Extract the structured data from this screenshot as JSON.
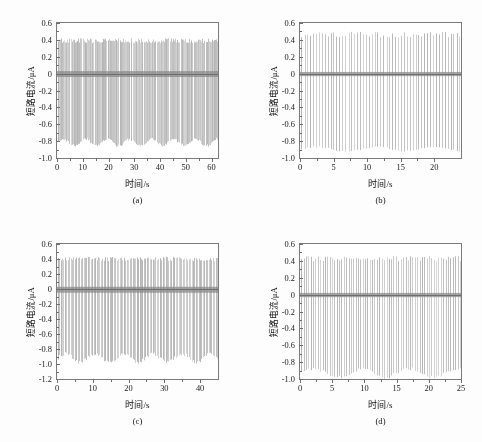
{
  "figure": {
    "axis_title_y": "短路电流/μA",
    "axis_title_x": "时间/s",
    "trace_color": "#b4b4b4",
    "trace_color_dark": "#8a8a8a",
    "axis_color": "#7a7a7a",
    "background": "#fdfdfd",
    "plot_background": "#ffffff"
  },
  "chart_data": [
    {
      "type": "line",
      "panel_label": "(a)",
      "title": "",
      "xlabel": "时间/s",
      "ylabel": "短路电流/μA",
      "xlim": [
        0,
        62.5
      ],
      "ylim": [
        -1.0,
        0.6
      ],
      "xticks": [
        0,
        10,
        20,
        30,
        40,
        50,
        60
      ],
      "yticks": [
        0.6,
        0.4,
        0.2,
        0,
        -0.2,
        -0.4,
        -0.6,
        -0.8,
        -1.0
      ],
      "ytick_labels": [
        "0.6",
        "0.4",
        "0.2",
        "0",
        "-0.2",
        "-0.4",
        "-0.6",
        "-0.8",
        "-1.0"
      ],
      "xtick_labels": [
        "0",
        "10",
        "20",
        "30",
        "40",
        "50",
        "60"
      ],
      "grid": false,
      "legend": "none",
      "signal": {
        "kind": "periodic-spike-train",
        "period_s": 0.42,
        "n_spikes": 148,
        "positive_peak": 0.42,
        "negative_peak": -0.82,
        "negative_peak_envelope_min": -0.87,
        "negative_peak_envelope_max": -0.76,
        "baseline": 0.0,
        "baseline_band": [
          -0.04,
          0.03
        ],
        "density": "very-dense"
      }
    },
    {
      "type": "line",
      "panel_label": "(b)",
      "title": "",
      "xlabel": "时间/s",
      "ylabel": "短路电流/μA",
      "xlim": [
        0,
        24.0
      ],
      "ylim": [
        -1.0,
        0.6
      ],
      "xticks": [
        0,
        5,
        10,
        15,
        20
      ],
      "yticks": [
        0.6,
        0.4,
        0.2,
        0,
        -0.2,
        -0.4,
        -0.6,
        -0.8,
        -1.0
      ],
      "ytick_labels": [
        "0.6",
        "0.4",
        "0.2",
        "0",
        "-0.2",
        "-0.4",
        "-0.6",
        "-0.8",
        "-1.0"
      ],
      "xtick_labels": [
        "0",
        "5",
        "10",
        "15",
        "20"
      ],
      "grid": false,
      "legend": "none",
      "signal": {
        "kind": "periodic-spike-train",
        "period_s": 0.43,
        "n_spikes": 55,
        "positive_peak": 0.5,
        "negative_peak": -0.9,
        "negative_peak_envelope_min": -0.93,
        "negative_peak_envelope_max": -0.86,
        "baseline": 0.0,
        "baseline_band": [
          -0.03,
          0.02
        ],
        "density": "discrete"
      }
    },
    {
      "type": "line",
      "panel_label": "(c)",
      "title": "",
      "xlabel": "时间/s",
      "ylabel": "短路电流/μA",
      "xlim": [
        0,
        45.0
      ],
      "ylim": [
        -1.2,
        0.6
      ],
      "xticks": [
        0,
        10,
        20,
        30,
        40
      ],
      "yticks": [
        0.6,
        0.4,
        0.2,
        0,
        -0.2,
        -0.4,
        -0.6,
        -0.8,
        -1.0,
        -1.2
      ],
      "ytick_labels": [
        "0.6",
        "0.4",
        "0.2",
        "0",
        "-0.2",
        "-0.4",
        "-0.6",
        "-0.8",
        "-1.0",
        "-1.2"
      ],
      "xtick_labels": [
        "0",
        "10",
        "20",
        "30",
        "40"
      ],
      "grid": false,
      "legend": "none",
      "signal": {
        "kind": "periodic-spike-train",
        "period_s": 0.4,
        "n_spikes": 112,
        "positive_peak": 0.43,
        "negative_peak": -0.92,
        "negative_peak_envelope_min": -1.0,
        "negative_peak_envelope_max": -0.84,
        "baseline": 0.0,
        "baseline_band": [
          -0.05,
          0.03
        ],
        "density": "dense"
      }
    },
    {
      "type": "line",
      "panel_label": "(d)",
      "title": "",
      "xlabel": "时间/s",
      "ylabel": "短路电流/μA",
      "xlim": [
        0,
        25.0
      ],
      "ylim": [
        -1.0,
        0.6
      ],
      "xticks": [
        0,
        5,
        10,
        15,
        20,
        25
      ],
      "yticks": [
        0.6,
        0.4,
        0.2,
        0,
        -0.2,
        -0.4,
        -0.6,
        -0.8,
        -1.0
      ],
      "ytick_labels": [
        "0.6",
        "0.4",
        "0.2",
        "0",
        "-0.2",
        "-0.4",
        "-0.6",
        "-0.8",
        "-1.0"
      ],
      "xtick_labels": [
        "0",
        "5",
        "10",
        "15",
        "20",
        "25"
      ],
      "grid": false,
      "legend": "none",
      "signal": {
        "kind": "periodic-spike-train",
        "period_s": 0.36,
        "n_spikes": 68,
        "positive_peak": 0.46,
        "negative_peak": -0.95,
        "negative_peak_envelope_min": -1.0,
        "negative_peak_envelope_max": -0.86,
        "baseline": 0.0,
        "baseline_band": [
          -0.03,
          0.02
        ],
        "density": "discrete"
      }
    }
  ]
}
